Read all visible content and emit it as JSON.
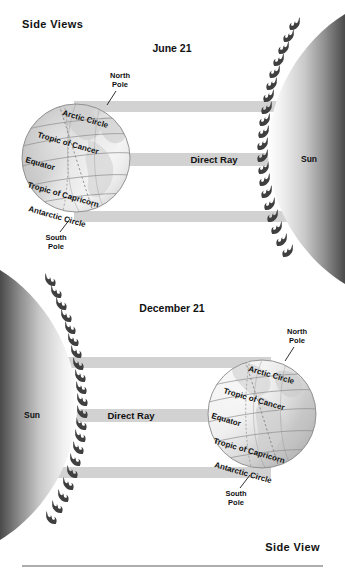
{
  "page": {
    "heading": "Side Views",
    "footer": "Side View",
    "background": "#ffffff"
  },
  "colors": {
    "ray_band": "#d2d2d2",
    "sun_core": "#f2f2f2",
    "sun_edge": "#3c3c3c",
    "globe_day": "#f4f4f4",
    "globe_night": "#bdbdbd",
    "text": "#111111",
    "rule": "#5d5d5d"
  },
  "panels": [
    {
      "id": "june",
      "date_label": "June 21",
      "sun": {
        "label": "Sun",
        "side": "right"
      },
      "globe": {
        "side": "left",
        "tilt_label": "north pole toward sun",
        "pole_labels": [
          {
            "name": "north-pole",
            "line1": "North",
            "line2": "Pole"
          },
          {
            "name": "south-pole",
            "line1": "South",
            "line2": "Pole"
          }
        ],
        "latitudes": [
          "Arctic Circle",
          "Tropic of Cancer",
          "Equator",
          "Tropic of Capricorn",
          "Antarctic Circle"
        ]
      },
      "rays": [
        {
          "name": "ray-upper",
          "label": ""
        },
        {
          "name": "ray-direct",
          "label": "Direct Ray"
        },
        {
          "name": "ray-lower",
          "label": ""
        }
      ]
    },
    {
      "id": "december",
      "date_label": "December 21",
      "sun": {
        "label": "Sun",
        "side": "left"
      },
      "globe": {
        "side": "right",
        "tilt_label": "south pole toward sun",
        "pole_labels": [
          {
            "name": "north-pole",
            "line1": "North",
            "line2": "Pole"
          },
          {
            "name": "south-pole",
            "line1": "South",
            "line2": "Pole"
          }
        ],
        "latitudes": [
          "Arctic Circle",
          "Tropic of Cancer",
          "Equator",
          "Tropic of Capricorn",
          "Antarctic Circle"
        ]
      },
      "rays": [
        {
          "name": "ray-upper",
          "label": ""
        },
        {
          "name": "ray-direct",
          "label": "Direct Ray"
        },
        {
          "name": "ray-lower",
          "label": ""
        }
      ]
    }
  ]
}
